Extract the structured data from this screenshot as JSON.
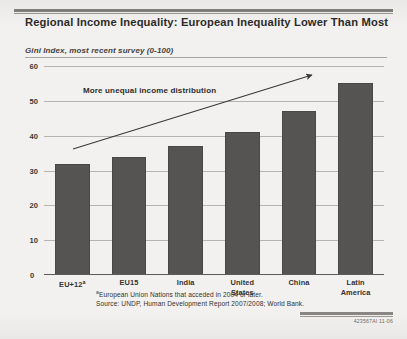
{
  "title": "Regional Income Inequality: European Inequality Lower Than Most",
  "subtitle": "Gini Index, most recent survey (0-100)",
  "annotation": "More unequal income distribution",
  "footnote_marker": "a",
  "footnote": "European Union Nations that acceded in 2004 or later.",
  "source": "Source: UNDP, Human Development Report 2007/2008; World Bank.",
  "doc_id": "423567AI  11-06",
  "colors": {
    "bar": "#565452",
    "gridline": "#b7b4af",
    "background": "#f2f1ef",
    "text": "#2c2b29"
  },
  "chart_data": {
    "type": "bar",
    "title": "Regional Income Inequality: European Inequality Lower Than Most",
    "subtitle": "Gini Index, most recent survey (0-100)",
    "categories": [
      "EU+12 a",
      "EU15",
      "India",
      "United States",
      "China",
      "Latin America"
    ],
    "category_labels": [
      {
        "line1": "EU+12",
        "sup": "a",
        "line2": ""
      },
      {
        "line1": "EU15",
        "sup": "",
        "line2": ""
      },
      {
        "line1": "India",
        "sup": "",
        "line2": ""
      },
      {
        "line1": "United",
        "sup": "",
        "line2": "States"
      },
      {
        "line1": "China",
        "sup": "",
        "line2": ""
      },
      {
        "line1": "Latin",
        "sup": "",
        "line2": "America"
      }
    ],
    "values": [
      32,
      34,
      37,
      41,
      47,
      55
    ],
    "xlabel": "",
    "ylabel": "Gini Index",
    "ylim": [
      0,
      60
    ],
    "yticks": [
      0,
      10,
      20,
      30,
      40,
      50,
      60
    ],
    "grid": true,
    "legend": "none",
    "annotations": [
      {
        "text": "More unequal income distribution",
        "type": "arrow-label"
      }
    ]
  }
}
